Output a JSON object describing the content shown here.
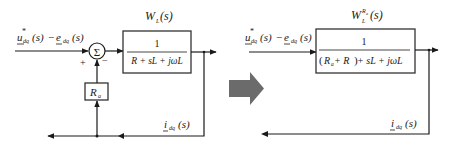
{
  "left_diagram": {
    "input_label": {
      "u": "u",
      "u_sup": "*",
      "u_sub": "dq",
      "s1": "(s)",
      "minus": "−",
      "e": "e",
      "e_sub": "dq",
      "s2": "(s)"
    },
    "sum_symbol": "Σ",
    "plus_sign": "+",
    "minus_sign": "−",
    "block": {
      "title_W": "W",
      "title_sub": "L",
      "title_arg": "(s)",
      "numerator": "1",
      "denominator": "R + sL + jωL"
    },
    "feedback_gain": {
      "R": "R",
      "sub": "a"
    },
    "output_label": {
      "i": "i",
      "sub": "dq",
      "arg": "(s)"
    }
  },
  "transform_arrow": {
    "color": "#6b6b6b"
  },
  "right_diagram": {
    "input_label": {
      "u": "u",
      "u_sup": "*",
      "u_sub": "dq",
      "s1": "(s)",
      "minus": "−",
      "e": "e",
      "e_sub": "dq",
      "s2": "(s)"
    },
    "block": {
      "title_W": "W",
      "title_sub": "L",
      "title_sup": "R",
      "title_sup_sub": "a",
      "title_arg": "(s)",
      "numerator": "1",
      "denominator": "(Ra + R) + sL + jωL",
      "den_open": "(",
      "den_Ra": "R",
      "den_Ra_sub": "a",
      "den_mid": " + R",
      "den_close": ")",
      "den_rest": " + sL + jωL"
    },
    "output_label": {
      "i": "i",
      "sub": "dq",
      "arg": "(s)"
    }
  },
  "colors": {
    "line": "#1a1a1a",
    "arrow": "#6b6b6b",
    "background": "#ffffff"
  }
}
